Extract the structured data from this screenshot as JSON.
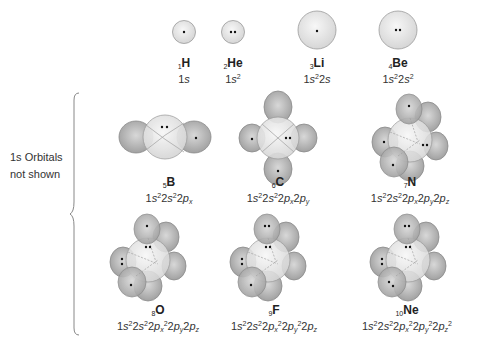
{
  "side_note": {
    "line1": "1s Orbitals",
    "line2": "not shown"
  },
  "row1": [
    {
      "z": "1",
      "symbol": "H",
      "config_html": "1<i>s</i>"
    },
    {
      "z": "2",
      "symbol": "He",
      "config_html": "1<i>s</i><sup>2</sup>"
    },
    {
      "z": "3",
      "symbol": "Li",
      "config_html": "1<i>s</i><sup>2</sup>2<i>s</i>"
    },
    {
      "z": "4",
      "symbol": "Be",
      "config_html": "1<i>s</i><sup>2</sup>2<i>s</i><sup>2</sup>"
    }
  ],
  "row2": [
    {
      "z": "5",
      "symbol": "B",
      "config_html": "1<i>s</i><sup>2</sup>2<i>s</i><sup>2</sup>2<i>p<sub>x</sub></i>"
    },
    {
      "z": "6",
      "symbol": "C",
      "config_html": "1<i>s</i><sup>2</sup>2<i>s</i><sup>2</sup>2<i>p<sub>x</sub></i>2<i>p<sub>y</sub></i>"
    },
    {
      "z": "7",
      "symbol": "N",
      "config_html": "1<i>s</i><sup>2</sup>2<i>s</i><sup>2</sup>2<i>p<sub>x</sub></i>2<i>p<sub>y</sub></i>2<i>p<sub>z</sub></i>"
    }
  ],
  "row3": [
    {
      "z": "8",
      "symbol": "O",
      "config_html": "1<i>s</i><sup>2</sup>2<i>s</i><sup>2</sup>2<i>p<sub>x</sub></i><sup>2</sup>2<i>p<sub>y</sub></i>2<i>p<sub>z</sub></i>"
    },
    {
      "z": "9",
      "symbol": "F",
      "config_html": "1<i>s</i><sup>2</sup>2<i>s</i><sup>2</sup>2<i>p<sub>x</sub></i><sup>2</sup>2<i>p<sub>y</sub></i><sup>2</sup>2<i>p<sub>z</sub></i>"
    },
    {
      "z": "10",
      "symbol": "Ne",
      "config_html": "1<i>s</i><sup>2</sup>2<i>s</i><sup>2</sup>2<i>p<sub>x</sub></i><sup>2</sup>2<i>p<sub>y</sub></i><sup>2</sup>2<i>p<sub>z</sub></i><sup>2</sup>"
    }
  ],
  "colors": {
    "s_orbital": "#e6e6e6",
    "p_orbital": "#b8b8b8",
    "outline": "#9a9a9a",
    "electron": "#111111"
  }
}
